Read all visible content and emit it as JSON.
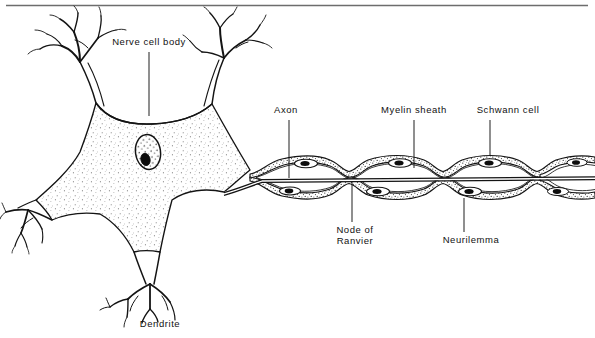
{
  "figure": {
    "kind": "biology-diagram",
    "line_color": "#141414",
    "fill_color": "#ffffff",
    "stipple_color": "#555555",
    "background": "#ffffff",
    "top_rule": true
  },
  "labels": {
    "nerve_cell_body": "Nerve cell body",
    "axon": "Axon",
    "myelin_sheath": "Myelin sheath",
    "schwann_cell": "Schwann cell",
    "node_of_ranvier_line1": "Node of",
    "node_of_ranvier_line2": "Ranvier",
    "neurilemma": "Neurilemma",
    "dendrite": "Dendrite"
  },
  "annotations": [
    {
      "name": "nerve-cell-body",
      "text": "Nerve cell body",
      "x": 149,
      "y": 44,
      "leader": {
        "x1": 149,
        "y1": 52,
        "x2": 149,
        "y2": 114
      }
    },
    {
      "name": "axon",
      "text": "Axon",
      "x": 289,
      "y": 112,
      "leader": {
        "x1": 289,
        "y1": 120,
        "x2": 289,
        "y2": 172
      }
    },
    {
      "name": "myelin-sheath",
      "text": "Myelin sheath",
      "x": 414,
      "y": 112,
      "leader": {
        "x1": 414,
        "y1": 120,
        "x2": 414,
        "y2": 165
      }
    },
    {
      "name": "schwann-cell",
      "text": "Schwann cell",
      "x": 507,
      "y": 112,
      "leader": {
        "x1": 490,
        "y1": 120,
        "x2": 490,
        "y2": 153
      }
    },
    {
      "name": "node-of-ranvier",
      "text": "Node of Ranvier",
      "x": 359,
      "y": 228,
      "leader": {
        "x1": 359,
        "y1": 190,
        "x2": 359,
        "y2": 222
      }
    },
    {
      "name": "neurilemma",
      "text": "Neurilemma",
      "x": 472,
      "y": 238,
      "leader": {
        "x1": 464,
        "y1": 196,
        "x2": 464,
        "y2": 232
      }
    },
    {
      "name": "dendrite",
      "text": "Dendrite",
      "x": 160,
      "y": 322,
      "leader": null
    }
  ],
  "structures": {
    "soma": {
      "name": "cell-body",
      "center_x": 150,
      "center_y": 190,
      "texture": "stipple"
    },
    "nucleus": {
      "name": "nucleus",
      "cx": 148,
      "cy": 152,
      "rx": 12,
      "ry": 17
    },
    "nucleolus": {
      "name": "nucleolus",
      "cx": 145,
      "cy": 159,
      "rx": 4.5,
      "ry": 6
    },
    "dendrites": [
      {
        "name": "dendrite-upper-left"
      },
      {
        "name": "dendrite-upper-right"
      },
      {
        "name": "dendrite-left"
      },
      {
        "name": "dendrite-bottom"
      }
    ],
    "axon": {
      "name": "axon-fiber",
      "start_x": 232,
      "end_x": 595,
      "y": 175
    },
    "myelin_segments": 5,
    "nodes_of_ranvier": 4
  }
}
